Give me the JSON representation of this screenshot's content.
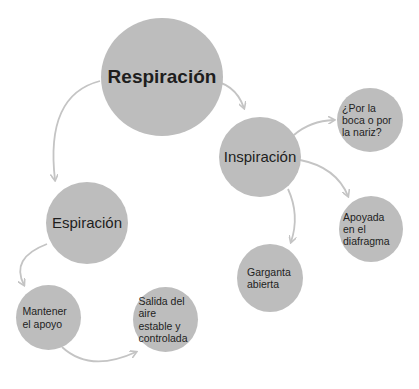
{
  "diagram": {
    "title": "Respiración",
    "colors": {
      "node_fill": "#bdbdbd",
      "text": "#1e1e1e",
      "arrow": "#c4c4c4",
      "background": "#ffffff"
    },
    "nodes": {
      "respiracion": {
        "label": "Respiración"
      },
      "inspiracion": {
        "label": "Inspiración"
      },
      "espiracion": {
        "label": "Espiración"
      },
      "boca_nariz": {
        "label": "¿Por la boca o por la nariz?"
      },
      "diafragma": {
        "label": "Apoyada en el diafragma"
      },
      "garganta": {
        "label": "Garganta abierta"
      },
      "mantener": {
        "label": "Mantener el apoyo"
      },
      "salida": {
        "label": "Salida del aire estable y controlada"
      }
    },
    "edges": [
      {
        "from": "Respiración",
        "to": "Inspiración"
      },
      {
        "from": "Respiración",
        "to": "Espiración"
      },
      {
        "from": "Inspiración",
        "to": "¿Por la boca o por la nariz?"
      },
      {
        "from": "Inspiración",
        "to": "Apoyada en el diafragma"
      },
      {
        "from": "Inspiración",
        "to": "Garganta abierta"
      },
      {
        "from": "Espiración",
        "to": "Mantener el apoyo"
      },
      {
        "from": "Mantener el apoyo",
        "to": "Salida del aire estable y controlada"
      }
    ]
  }
}
